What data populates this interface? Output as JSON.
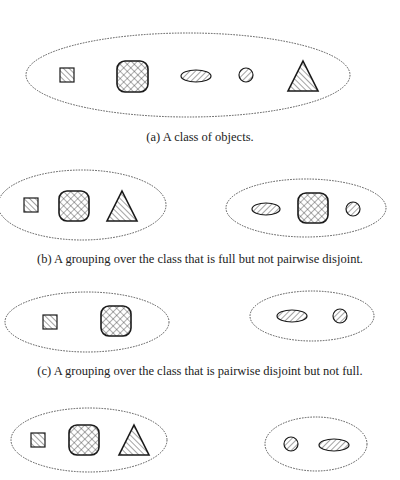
{
  "figure": {
    "colors": {
      "stroke": "#1a1a1a",
      "dashed": "#555555",
      "background": "#ffffff"
    },
    "panels": [
      {
        "id": "a",
        "caption": "(a) A class of objects.",
        "caption_y": 130,
        "groups": [
          {
            "ellipse": {
              "cx": 188,
              "cy": 75,
              "rx": 162,
              "ry": 42
            },
            "objects": [
              {
                "shape": "square",
                "x": 60,
                "y": 68,
                "w": 14,
                "h": 14
              },
              {
                "shape": "rounded-square",
                "x": 117,
                "y": 61,
                "w": 31,
                "h": 31
              },
              {
                "shape": "oval",
                "cx": 196,
                "cy": 76,
                "rx": 15,
                "ry": 6
              },
              {
                "shape": "circle",
                "cx": 246,
                "cy": 75,
                "r": 7
              },
              {
                "shape": "triangle",
                "x": 288,
                "y": 61,
                "w": 30,
                "h": 30
              }
            ]
          }
        ]
      },
      {
        "id": "b",
        "caption": "(b) A grouping over the class that is full but not pairwise disjoint.",
        "caption_y": 252,
        "groups": [
          {
            "ellipse": {
              "cx": 82,
              "cy": 205,
              "rx": 84,
              "ry": 35
            },
            "objects": [
              {
                "shape": "square",
                "x": 24,
                "y": 198,
                "w": 14,
                "h": 14
              },
              {
                "shape": "rounded-square",
                "x": 59,
                "y": 191,
                "w": 30,
                "h": 30
              },
              {
                "shape": "triangle",
                "x": 107,
                "y": 191,
                "w": 30,
                "h": 30
              }
            ]
          },
          {
            "ellipse": {
              "cx": 306,
              "cy": 208,
              "rx": 80,
              "ry": 29
            },
            "objects": [
              {
                "shape": "oval",
                "cx": 266,
                "cy": 209,
                "rx": 14,
                "ry": 6
              },
              {
                "shape": "rounded-square",
                "x": 298,
                "y": 193,
                "w": 30,
                "h": 30
              },
              {
                "shape": "circle",
                "cx": 353,
                "cy": 209,
                "r": 7
              }
            ]
          }
        ]
      },
      {
        "id": "c",
        "caption": "(c) A grouping over the class that is pairwise disjoint but not full.",
        "caption_y": 364,
        "groups": [
          {
            "ellipse": {
              "cx": 87,
              "cy": 322,
              "rx": 82,
              "ry": 30
            },
            "objects": [
              {
                "shape": "square",
                "x": 43,
                "y": 315,
                "w": 14,
                "h": 14
              },
              {
                "shape": "rounded-square",
                "x": 101,
                "y": 306,
                "w": 30,
                "h": 30
              }
            ]
          },
          {
            "ellipse": {
              "cx": 312,
              "cy": 316,
              "rx": 62,
              "ry": 25
            },
            "objects": [
              {
                "shape": "oval",
                "cx": 292,
                "cy": 316,
                "rx": 15,
                "ry": 6
              },
              {
                "shape": "circle",
                "cx": 340,
                "cy": 316,
                "r": 7
              }
            ]
          }
        ]
      },
      {
        "id": "d",
        "caption": "",
        "caption_y": 0,
        "groups": [
          {
            "ellipse": {
              "cx": 89,
              "cy": 440,
              "rx": 78,
              "ry": 32
            },
            "objects": [
              {
                "shape": "square",
                "x": 31,
                "y": 433,
                "w": 14,
                "h": 14
              },
              {
                "shape": "rounded-square",
                "x": 69,
                "y": 425,
                "w": 30,
                "h": 30
              },
              {
                "shape": "triangle",
                "x": 119,
                "y": 425,
                "w": 30,
                "h": 30
              }
            ]
          },
          {
            "ellipse": {
              "cx": 316,
              "cy": 444,
              "rx": 51,
              "ry": 27
            },
            "objects": [
              {
                "shape": "circle",
                "cx": 291,
                "cy": 444,
                "r": 7
              },
              {
                "shape": "oval",
                "cx": 334,
                "cy": 445,
                "rx": 15,
                "ry": 6
              }
            ]
          }
        ]
      }
    ]
  }
}
